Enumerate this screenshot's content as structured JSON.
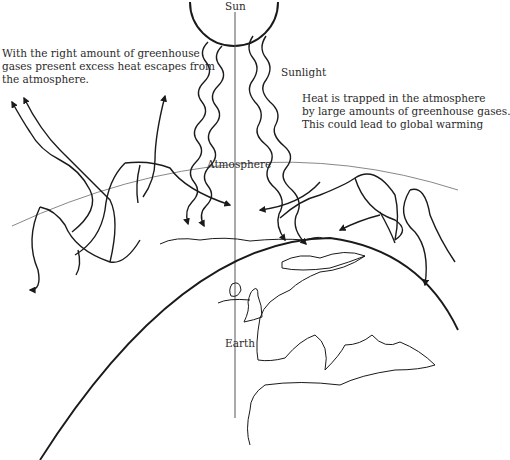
{
  "diagram": {
    "type": "greenhouse-effect-illustration",
    "labels": {
      "sun": "Sun",
      "sunlight": "Sunlight",
      "atmosphere": "Atmosphere",
      "earth": "Earth"
    },
    "captions": {
      "left": [
        "With the right amount of greenhouse",
        "gases present excess heat escapes from",
        "the atmosphere."
      ],
      "right": [
        "Heat is trapped in the atmosphere",
        "by large amounts of greenhouse gases.",
        "This could lead to global warming"
      ]
    },
    "colors": {
      "line": "#1a1a1a",
      "thin_line": "#777777",
      "text": "#2a2a2a",
      "background": "#ffffff"
    }
  }
}
